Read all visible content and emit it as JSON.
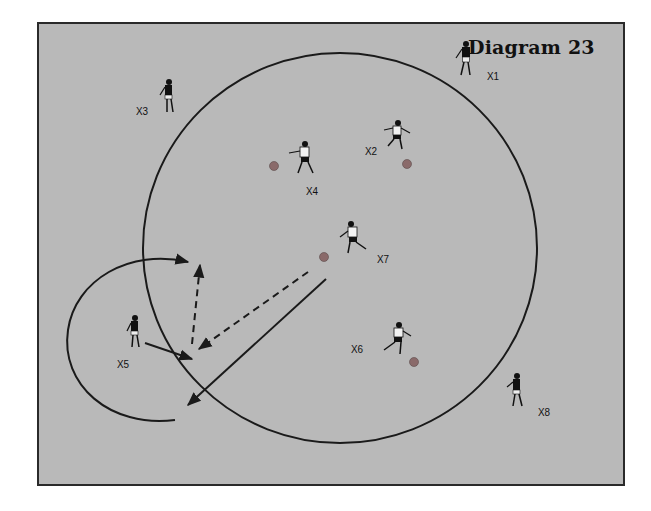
{
  "diagram": {
    "title": "Diagram 23",
    "background_color": "#b9b9b9",
    "line_color": "#1a1a1a",
    "ball_color": "#8a6a6a",
    "players": [
      {
        "id": "X1",
        "label": "X1",
        "x": 466,
        "y": 62,
        "shirt": "dark",
        "label_x": 487,
        "label_y": 75
      },
      {
        "id": "X2",
        "label": "X2",
        "x": 396,
        "y": 138,
        "shirt": "light",
        "label_x": 365,
        "label_y": 150
      },
      {
        "id": "X3",
        "label": "X3",
        "x": 168,
        "y": 100,
        "shirt": "dark",
        "label_x": 136,
        "label_y": 110
      },
      {
        "id": "X4",
        "label": "X4",
        "x": 304,
        "y": 160,
        "shirt": "light",
        "label_x": 306,
        "label_y": 190
      },
      {
        "id": "X5",
        "label": "X5",
        "x": 134,
        "y": 335,
        "shirt": "dark",
        "label_x": 117,
        "label_y": 363
      },
      {
        "id": "X6",
        "label": "X6",
        "x": 397,
        "y": 340,
        "shirt": "light",
        "label_x": 351,
        "label_y": 348
      },
      {
        "id": "X7",
        "label": "X7",
        "x": 352,
        "y": 240,
        "shirt": "light",
        "label_x": 377,
        "label_y": 258
      },
      {
        "id": "X8",
        "label": "X8",
        "x": 516,
        "y": 393,
        "shirt": "dark",
        "label_x": 538,
        "label_y": 411
      }
    ],
    "balls": [
      {
        "x": 274,
        "y": 166
      },
      {
        "x": 407,
        "y": 164
      },
      {
        "x": 324,
        "y": 257
      },
      {
        "x": 414,
        "y": 362
      }
    ],
    "big_circle": {
      "cx": 340,
      "cy": 248,
      "rx": 197,
      "ry": 195
    },
    "paths": [
      {
        "name": "x5-run-arc",
        "type": "solid-arc"
      },
      {
        "name": "x5-pass",
        "type": "solid-arrow"
      },
      {
        "name": "x7-long-pass",
        "type": "solid-arrow"
      },
      {
        "name": "x7-dribble-dashed",
        "type": "dashed-arrow"
      },
      {
        "name": "x5-upfield-dashed",
        "type": "dashed-arrow"
      }
    ]
  }
}
